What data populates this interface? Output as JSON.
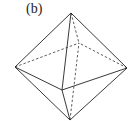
{
  "figure": {
    "label": "(b)",
    "shape": "octahedron",
    "vertices": {
      "top": [
        71,
        13
      ],
      "bottom": [
        70,
        120
      ],
      "left": [
        15,
        67
      ],
      "right": [
        127,
        68
      ],
      "front": [
        62,
        90
      ],
      "back": [
        79,
        43
      ]
    },
    "line_color": "#222222"
  }
}
